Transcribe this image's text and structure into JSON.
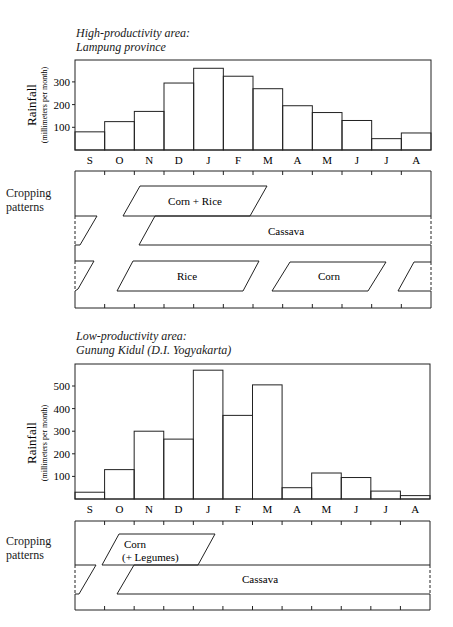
{
  "panels": [
    {
      "title_line1": "High-productivity area:",
      "title_line2": "Lampung province",
      "ylabel": "Rainfall",
      "ylabel_sub": "(millimeters per month)",
      "yticks": [
        "100",
        "200",
        "300"
      ],
      "crop_label_1": "Cropping",
      "crop_label_2": "patterns",
      "crops": {
        "corn_rice": "Corn  +  Rice",
        "cassava": "Cassava",
        "rice": "Rice",
        "corn": "Corn"
      }
    },
    {
      "title_line1": "Low-productivity area:",
      "title_line2": "Gunung Kidul (D.I. Yogyakarta)",
      "ylabel": "Rainfall",
      "ylabel_sub": "(millimeters per month)",
      "yticks": [
        "100",
        "200",
        "300",
        "400",
        "500"
      ],
      "crop_label_1": "Cropping",
      "crop_label_2": "patterns",
      "crops": {
        "corn_line1": "Corn",
        "corn_line2": "(+  Legumes)",
        "cassava": "Cassava"
      }
    }
  ],
  "months": [
    "S",
    "O",
    "N",
    "D",
    "J",
    "F",
    "M",
    "A",
    "M",
    "J",
    "J",
    "A"
  ],
  "chart_data": [
    {
      "type": "bar",
      "title": "High-productivity area: Lampung province",
      "xlabel": "",
      "ylabel": "Rainfall (millimeters per month)",
      "categories": [
        "S",
        "O",
        "N",
        "D",
        "J",
        "F",
        "M",
        "A",
        "M",
        "J",
        "J",
        "A"
      ],
      "values": [
        80,
        125,
        170,
        295,
        360,
        325,
        270,
        195,
        165,
        130,
        50,
        75
      ],
      "yticks": [
        100,
        200,
        300
      ],
      "ylim": [
        0,
        400
      ],
      "grid": false,
      "legend": null
    },
    {
      "type": "bar",
      "title": "Low-productivity area: Gunung Kidul (D.I. Yogyakarta)",
      "xlabel": "",
      "ylabel": "Rainfall (millimeters per month)",
      "categories": [
        "S",
        "O",
        "N",
        "D",
        "J",
        "F",
        "M",
        "A",
        "M",
        "J",
        "J",
        "A"
      ],
      "values": [
        30,
        130,
        300,
        265,
        570,
        370,
        505,
        50,
        115,
        95,
        35,
        15
      ],
      "yticks": [
        100,
        200,
        300,
        400,
        500
      ],
      "ylim": [
        0,
        600
      ],
      "grid": false,
      "legend": null
    }
  ]
}
